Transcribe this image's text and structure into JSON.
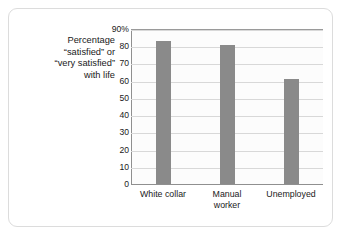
{
  "chart_data": {
    "type": "bar",
    "title": "",
    "subtitle": "",
    "xlabel": "",
    "ylabel_lines": [
      "Percentage",
      "“satisfied” or",
      "“very satisfied”",
      "with life"
    ],
    "categories": [
      "White collar",
      "Manual worker",
      "Unemployed"
    ],
    "category_label_lines": [
      [
        "White collar"
      ],
      [
        "Manual",
        "worker"
      ],
      [
        "Unemployed"
      ]
    ],
    "values": [
      83,
      81,
      61
    ],
    "ylim": [
      0,
      90
    ],
    "yticks": [
      0,
      10,
      20,
      30,
      40,
      50,
      60,
      70,
      80,
      90
    ],
    "ytick_labels": [
      "0",
      "10",
      "20",
      "30",
      "40",
      "50",
      "60",
      "70",
      "80",
      "90%"
    ],
    "grid": true,
    "legend": "none",
    "bar_color": "#8a8a8a",
    "gridline_color": "#d8d8d8",
    "axis_color": "#8f8f8f",
    "plot_background": "#fcfcfc",
    "card_background": "#ffffff",
    "card_border_color": "#dcdcdc"
  }
}
